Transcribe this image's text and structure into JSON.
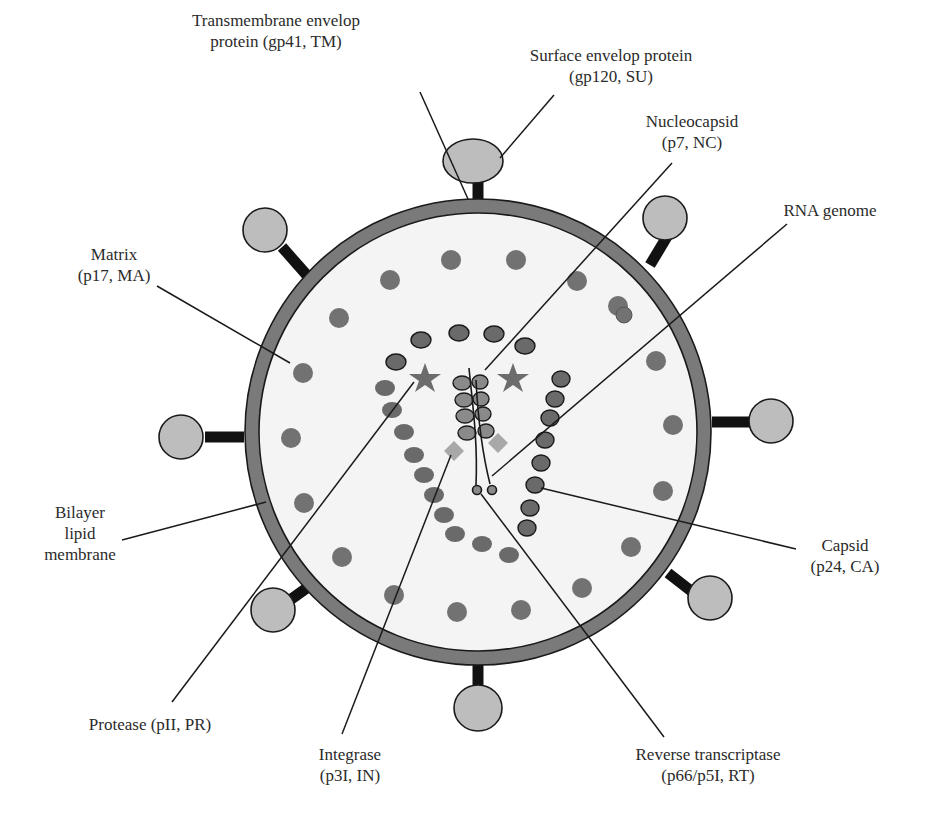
{
  "diagram": {
    "colors": {
      "membrane": "#7a7a7a",
      "interior": "#f4f4f4",
      "matrix_dot": "#727272",
      "capsid_oval": "#6a6a6a",
      "nucleocapsid": "#8a8a8a",
      "spike_head": "#bdbdbd",
      "spike_stalk": "#111111",
      "star": "#6c6c6c",
      "diamond": "#a8a8a8",
      "line": "#1a1a1a"
    },
    "labels": {
      "tm": {
        "line1": "Transmembrane envelop",
        "line2": "protein (gp41, TM)"
      },
      "su": {
        "line1": "Surface envelop protein",
        "line2": "(gp120, SU)"
      },
      "nc": {
        "line1": "Nucleocapsid",
        "line2": "(p7, NC)"
      },
      "rna": {
        "line1": "RNA genome"
      },
      "ma": {
        "line1": "Matrix",
        "line2": "(p17, MA)"
      },
      "membrane": {
        "line1": "Bilayer",
        "line2": "lipid",
        "line3": "membrane"
      },
      "ca": {
        "line1": "Capsid",
        "line2": "(p24, CA)"
      },
      "pr": {
        "line1": "Protease (pII, PR)"
      },
      "in": {
        "line1": "Integrase",
        "line2": "(p3I, IN)"
      },
      "rt": {
        "line1": "Reverse transcriptase",
        "line2": "(p66/p5I, RT)"
      }
    }
  }
}
